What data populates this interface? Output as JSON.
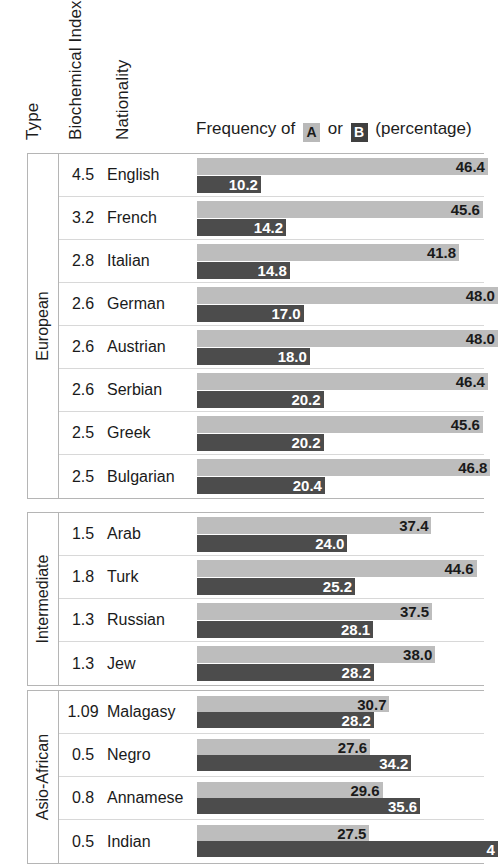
{
  "headers": {
    "type": "Type",
    "biochemical_index": "Biochemical Index",
    "nationality": "Nationality"
  },
  "legend": {
    "prefix": "Frequency of",
    "badge_a": "A",
    "middle": "or",
    "badge_b": "B",
    "suffix": "(percentage)",
    "color_a": "#bdbdbd",
    "color_b": "#4c4c4c"
  },
  "chart_data": {
    "type": "bar",
    "title": "Frequency of A or B (percentage)",
    "orientation": "horizontal",
    "xlabel": "percentage",
    "ylabel": "Nationality",
    "xlim": [
      0,
      46.4
    ],
    "grid": false,
    "legend_position": "top",
    "series": [
      {
        "name": "A",
        "color": "#bdbdbd"
      },
      {
        "name": "B",
        "color": "#4c4c4c"
      }
    ],
    "groups": [
      {
        "type": "European",
        "rows": [
          {
            "index": "4.5",
            "nationality": "English",
            "a": "46.4",
            "b": "10.2"
          },
          {
            "index": "3.2",
            "nationality": "French",
            "a": "45.6",
            "b": "14.2"
          },
          {
            "index": "2.8",
            "nationality": "Italian",
            "a": "41.8",
            "b": "14.8"
          },
          {
            "index": "2.6",
            "nationality": "German",
            "a": "48.0",
            "b": "17.0"
          },
          {
            "index": "2.6",
            "nationality": "Austrian",
            "a": "48.0",
            "b": "18.0"
          },
          {
            "index": "2.6",
            "nationality": "Serbian",
            "a": "46.4",
            "b": "20.2"
          },
          {
            "index": "2.5",
            "nationality": "Greek",
            "a": "45.6",
            "b": "20.2"
          },
          {
            "index": "2.5",
            "nationality": "Bulgarian",
            "a": "46.8",
            "b": "20.4"
          }
        ]
      },
      {
        "type": "Intermediate",
        "rows": [
          {
            "index": "1.5",
            "nationality": "Arab",
            "a": "37.4",
            "b": "24.0"
          },
          {
            "index": "1.8",
            "nationality": "Turk",
            "a": "44.6",
            "b": "25.2"
          },
          {
            "index": "1.3",
            "nationality": "Russian",
            "a": "37.5",
            "b": "28.1"
          },
          {
            "index": "1.3",
            "nationality": "Jew",
            "a": "38.0",
            "b": "28.2"
          }
        ]
      },
      {
        "type": "Asio-African",
        "rows": [
          {
            "index": "1.09",
            "nationality": "Malagasy",
            "a": "30.7",
            "b": "28.2"
          },
          {
            "index": "0.5",
            "nationality": "Negro",
            "a": "27.6",
            "b": "34.2"
          },
          {
            "index": "0.8",
            "nationality": "Annamese",
            "a": "29.6",
            "b": "35.6"
          },
          {
            "index": "0.5",
            "nationality": "Indian",
            "a": "27.5",
            "b": "4"
          }
        ]
      }
    ]
  }
}
